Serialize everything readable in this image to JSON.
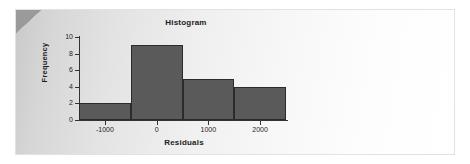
{
  "panel": {
    "corner_fold_color": "#9a9a9a",
    "background_gradient_from": "#c9c9c9",
    "background_gradient_to": "#ffffff"
  },
  "chart_data": {
    "type": "bar",
    "title": "Histogram",
    "xlabel": "Residuals",
    "ylabel": "Frequency",
    "grid": false,
    "legend": null,
    "bar_color": "#5a5a5a",
    "bar_edge_color": "#2b2b2b",
    "axis_color": "#333333",
    "bin_edges": [
      -1500,
      -500,
      500,
      1500,
      2500
    ],
    "categories": [
      "-1500 to -500",
      "-500 to 500",
      "500 to 1500",
      "1500 to 2500"
    ],
    "bin_centers": [
      -1000,
      0,
      1000,
      2000
    ],
    "values": [
      2,
      9,
      5,
      4
    ],
    "xlim": [
      -1500,
      2500
    ],
    "ylim": [
      0,
      10
    ],
    "xticks": [
      -1000,
      0,
      1000,
      2000
    ],
    "xtick_labels": [
      "-1000",
      "0",
      "1000",
      "2000"
    ],
    "yticks": [
      0,
      2,
      4,
      6,
      8,
      10
    ],
    "ytick_labels": [
      "0",
      "2",
      "4",
      "6",
      "8",
      "10"
    ]
  }
}
